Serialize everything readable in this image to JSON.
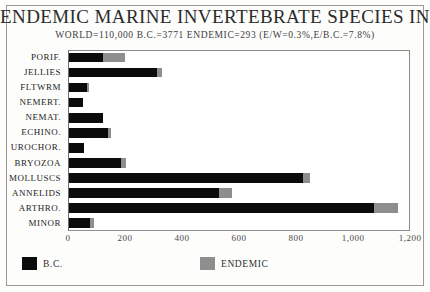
{
  "chart_data": {
    "type": "bar",
    "orientation": "horizontal",
    "stacked": true,
    "title": "ENDEMIC MARINE INVERTEBRATE SPECIES IN B.C.",
    "subtitle": "WORLD=110,000  B.C.=3771  ENDEMIC=293 (E/W=0.3%,E/B.C.=7.8%)",
    "xlabel": "",
    "ylabel": "",
    "xlim": [
      0,
      1200
    ],
    "grid": false,
    "legend_position": "bottom",
    "categories": [
      "PORIF.",
      "JELLIES",
      "FLTWRM",
      "NEMERT.",
      "NEMAT.",
      "ECHINO.",
      "UROCHOR.",
      "BRYOZOA",
      "MOLLUSCS",
      "ANNELIDS",
      "ARTHRO.",
      "MINOR"
    ],
    "series": [
      {
        "name": "B.C.",
        "color": "#0b0b0b",
        "values": [
          118,
          308,
          62,
          48,
          121,
          136,
          51,
          183,
          822,
          528,
          1071,
          73
        ]
      },
      {
        "name": "ENDEMIC",
        "color": "#8e8e8e",
        "values": [
          80,
          18,
          8,
          0,
          0,
          11,
          0,
          18,
          22,
          44,
          84,
          15
        ]
      }
    ],
    "xticks": [
      {
        "value": 0,
        "label": "0"
      },
      {
        "value": 200,
        "label": "200"
      },
      {
        "value": 400,
        "label": "400"
      },
      {
        "value": 600,
        "label": "600"
      },
      {
        "value": 800,
        "label": "800"
      },
      {
        "value": 1000,
        "label": "1,000"
      },
      {
        "value": 1200,
        "label": "1,200"
      }
    ],
    "legend": [
      {
        "label": "B.C.",
        "color": "#0b0b0b"
      },
      {
        "label": "ENDEMIC",
        "color": "#8e8e8e"
      }
    ]
  }
}
